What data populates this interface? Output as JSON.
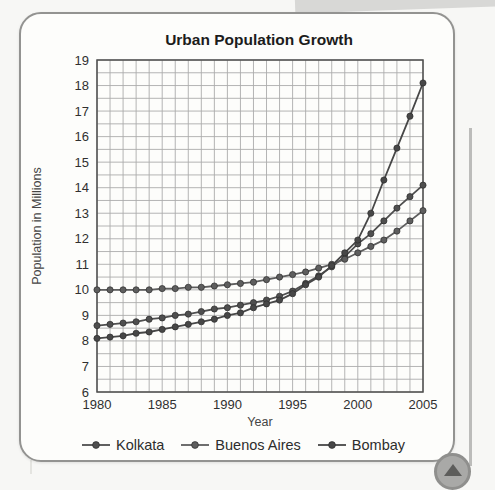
{
  "chart_data": {
    "type": "line",
    "title": "Urban Population Growth",
    "xlabel": "Year",
    "ylabel": "Population in Millions",
    "xlim": [
      1980,
      2005
    ],
    "ylim": [
      6,
      19
    ],
    "x_major_ticks": [
      1980,
      1985,
      1990,
      1995,
      2000,
      2005
    ],
    "y_major_ticks": [
      6,
      7,
      8,
      9,
      10,
      11,
      12,
      13,
      14,
      15,
      16,
      17,
      18,
      19
    ],
    "grid": {
      "on": true,
      "x_step_years": 1,
      "y_step": 0.5,
      "color": "#ababab"
    },
    "frame_color": "#4e4e4e",
    "legend_position": "bottom",
    "marker": "circle",
    "years": [
      1980,
      1981,
      1982,
      1983,
      1984,
      1985,
      1986,
      1987,
      1988,
      1989,
      1990,
      1991,
      1992,
      1993,
      1994,
      1995,
      1996,
      1997,
      1998,
      1999,
      2000,
      2001,
      2002,
      2003,
      2004,
      2005
    ],
    "series": [
      {
        "name": "Kolkata",
        "color": "#4f4f4f",
        "values": [
          8.6,
          8.65,
          8.7,
          8.75,
          8.85,
          8.9,
          9.0,
          9.05,
          9.15,
          9.25,
          9.3,
          9.4,
          9.5,
          9.6,
          9.75,
          9.95,
          10.25,
          10.55,
          10.9,
          11.3,
          11.8,
          12.2,
          12.7,
          13.2,
          13.65,
          14.1
        ]
      },
      {
        "name": "Buenos Aires",
        "color": "#5e5e5e",
        "values": [
          10.0,
          10.0,
          10.0,
          10.0,
          10.0,
          10.05,
          10.05,
          10.1,
          10.1,
          10.15,
          10.2,
          10.25,
          10.3,
          10.4,
          10.5,
          10.6,
          10.7,
          10.85,
          11.0,
          11.2,
          11.45,
          11.7,
          11.95,
          12.3,
          12.7,
          13.1
        ]
      },
      {
        "name": "Bombay",
        "color": "#474747",
        "values": [
          8.1,
          8.15,
          8.2,
          8.3,
          8.35,
          8.45,
          8.55,
          8.65,
          8.75,
          8.85,
          9.0,
          9.1,
          9.3,
          9.45,
          9.6,
          9.85,
          10.2,
          10.5,
          10.95,
          11.45,
          11.95,
          13.0,
          14.3,
          15.55,
          16.8,
          18.1
        ]
      }
    ]
  }
}
